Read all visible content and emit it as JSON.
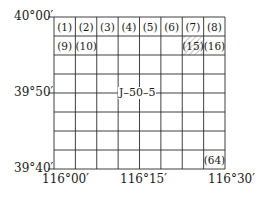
{
  "diagram": {
    "type": "map-sheet-index",
    "sheet_code": "J–50–5",
    "grid": {
      "rows": 8,
      "cols": 8
    },
    "latitude_labels": [
      {
        "text": "40°00′",
        "row_line": 0
      },
      {
        "text": "39°50′",
        "row_line": 4
      },
      {
        "text": "39°40′",
        "row_line": 8
      }
    ],
    "longitude_labels": [
      {
        "text": "116°00′",
        "col_line": 0
      },
      {
        "text": "116°15′",
        "col_line": 4
      },
      {
        "text": "116°30′",
        "col_line": 8
      }
    ],
    "cells": [
      {
        "text": "(1)",
        "row": 0,
        "col": 0
      },
      {
        "text": "(2)",
        "row": 0,
        "col": 1
      },
      {
        "text": "(3)",
        "row": 0,
        "col": 2
      },
      {
        "text": "(4)",
        "row": 0,
        "col": 3
      },
      {
        "text": "(5)",
        "row": 0,
        "col": 4
      },
      {
        "text": "(6)",
        "row": 0,
        "col": 5
      },
      {
        "text": "(7)",
        "row": 0,
        "col": 6
      },
      {
        "text": "(8)",
        "row": 0,
        "col": 7
      },
      {
        "text": "(9)",
        "row": 1,
        "col": 0
      },
      {
        "text": "(10)",
        "row": 1,
        "col": 1
      },
      {
        "text": "(15)",
        "row": 1,
        "col": 6,
        "hatched": true
      },
      {
        "text": "(16)",
        "row": 1,
        "col": 7
      },
      {
        "text": "(64)",
        "row": 7,
        "col": 7
      }
    ],
    "colors": {
      "line": "#2a2a2a",
      "text": "#1a1a1a",
      "hatch": "#555555",
      "background": "#ffffff"
    }
  }
}
